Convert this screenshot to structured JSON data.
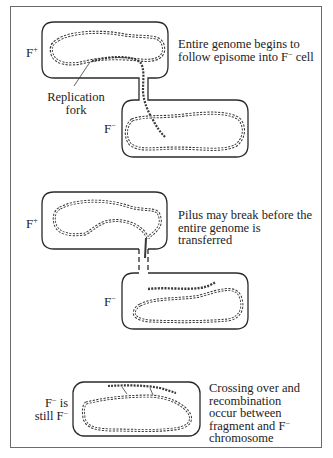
{
  "figure": {
    "panels": [
      {
        "id": "panel-1",
        "donor_label": {
          "base": "F",
          "sup": "+"
        },
        "recipient_label": {
          "base": "F",
          "sup": "−"
        },
        "caption_lines": [
          "Entire genome begins to",
          "follow episome into F",
          " cell"
        ],
        "caption": {
          "line1": "Entire genome begins to",
          "line2_pre": "follow episome into F",
          "line2_sup": "−",
          "line2_post": " cell"
        },
        "annotation": {
          "line1": "Replication",
          "line2": "fork"
        },
        "pilus": "solid"
      },
      {
        "id": "panel-2",
        "donor_label": {
          "base": "F",
          "sup": "+"
        },
        "recipient_label": {
          "base": "F",
          "sup": "−"
        },
        "caption": {
          "line1": "Pilus may break before the",
          "line2": "entire genome is",
          "line3": "transferred"
        },
        "pilus": "broken"
      },
      {
        "id": "panel-3",
        "cell_label": {
          "line1_base": "F",
          "line1_sup": "−",
          "line1_post": " is",
          "line2_pre": "still F",
          "line2_sup": "−"
        },
        "caption": {
          "line1": "Crossing over and",
          "line2": "recombination",
          "line3": "occur between",
          "line4_pre": "fragment and F",
          "line4_sup": "−",
          "line5": "chromosome"
        }
      }
    ],
    "colors": {
      "outline": "#2a2a2a",
      "dna": "#3a3a3a",
      "frame": "#6a6a6a",
      "background": "#ffffff"
    }
  }
}
